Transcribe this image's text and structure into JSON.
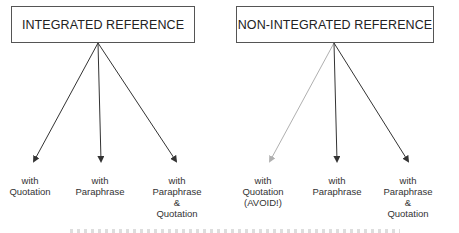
{
  "diagram": {
    "left": {
      "title": "INTEGRATED REFERENCE",
      "leaves": [
        {
          "lines": [
            "with",
            "Quotation"
          ],
          "arrow_style": "normal"
        },
        {
          "lines": [
            "with",
            "Paraphrase"
          ],
          "arrow_style": "normal"
        },
        {
          "lines": [
            "with",
            "Paraphrase",
            "&",
            "Quotation"
          ],
          "arrow_style": "normal"
        }
      ]
    },
    "right": {
      "title": "NON-INTEGRATED REFERENCE",
      "leaves": [
        {
          "lines": [
            "with",
            "Quotation",
            "(AVOID!)"
          ],
          "arrow_style": "faded"
        },
        {
          "lines": [
            "with",
            "Paraphrase"
          ],
          "arrow_style": "normal"
        },
        {
          "lines": [
            "with",
            "Paraphrase",
            "&",
            "Quotation"
          ],
          "arrow_style": "normal"
        }
      ]
    },
    "colors": {
      "arrow": "#333333",
      "arrow_faded": "#b0b0b0",
      "box_border": "#555555"
    }
  }
}
